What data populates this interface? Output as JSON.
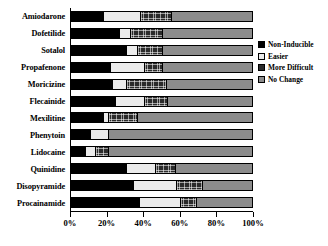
{
  "chart_data": {
    "type": "bar",
    "orientation": "horizontal",
    "stacked": true,
    "normalized_percent": true,
    "title": "",
    "xlabel": "",
    "ylabel": "",
    "xlim": [
      0,
      100
    ],
    "xticks": [
      0,
      20,
      40,
      60,
      80,
      100
    ],
    "xticklabels": [
      "0%",
      "20%",
      "40%",
      "60%",
      "80%",
      "100%"
    ],
    "grid": false,
    "legend_position": "right",
    "categories": [
      "Amiodarone",
      "Dofetilide",
      "Sotalol",
      "Propafenone",
      "Moricizine",
      "Flecainide",
      "Mexilitine",
      "Phenytoin",
      "Lidocaine",
      "Quinidine",
      "Disopyramide",
      "Procainamide"
    ],
    "series": [
      {
        "name": "Non-Inducible",
        "color": "#000000",
        "values": [
          17,
          26,
          30,
          21,
          22,
          24,
          17,
          10,
          7,
          30,
          34,
          37
        ]
      },
      {
        "name": "Easier",
        "color": "#ebebeb",
        "values": [
          21,
          6,
          6,
          19,
          8,
          16,
          3,
          10,
          6,
          16,
          24,
          23
        ]
      },
      {
        "name": "More Difficult",
        "color": "#2b2b2b",
        "values": [
          17,
          18,
          14,
          10,
          22,
          13,
          16,
          0,
          7,
          11,
          14,
          9
        ]
      },
      {
        "name": "No Change",
        "color": "#8c8c8c",
        "values": [
          45,
          50,
          50,
          50,
          48,
          47,
          64,
          80,
          80,
          43,
          28,
          31
        ]
      }
    ]
  },
  "legend": {
    "items": [
      {
        "label": "Non-Inducible",
        "key": "non-inducible"
      },
      {
        "label": "Easier",
        "key": "easier"
      },
      {
        "label": "More Difficult",
        "key": "more-difficult"
      },
      {
        "label": "No Change",
        "key": "no-change"
      }
    ]
  }
}
